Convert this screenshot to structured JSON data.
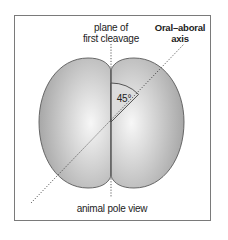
{
  "diagram": {
    "labels": {
      "plane_line1": "plane of",
      "plane_line2": "first cleavage",
      "axis_line1": "Oral–aboral",
      "axis_line2": "axis",
      "angle": "45°",
      "view": "animal pole view"
    },
    "colors": {
      "cell_fill_light": "#f4f4f4",
      "cell_fill_dark": "#a9a9a9",
      "cell_outline": "#5a5a5a",
      "frame_border": "#7a7a7a",
      "wedge_fill": "#dcdcdc",
      "line": "#333333"
    },
    "elements": [
      {
        "name": "left-blastomere",
        "type": "cell"
      },
      {
        "name": "right-blastomere",
        "type": "cell"
      },
      {
        "name": "first-cleavage-plane",
        "type": "dotted-line",
        "orientation": "vertical"
      },
      {
        "name": "oral-aboral-axis",
        "type": "dotted-line",
        "orientation": "diagonal"
      },
      {
        "name": "angle-marker",
        "type": "wedge",
        "value": "45°"
      }
    ]
  }
}
